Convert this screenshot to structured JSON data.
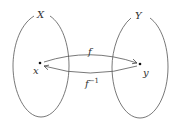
{
  "diagram": {
    "type": "function-mapping",
    "sets": [
      {
        "id": "X",
        "label": "X"
      },
      {
        "id": "Y",
        "label": "Y"
      }
    ],
    "points": [
      {
        "id": "x",
        "label": "x",
        "set": "X"
      },
      {
        "id": "y",
        "label": "y",
        "set": "Y"
      }
    ],
    "arrows": [
      {
        "id": "f",
        "label": "f",
        "from": "x",
        "to": "y"
      },
      {
        "id": "f_inv",
        "label": "f",
        "superscript": "−1",
        "from": "y",
        "to": "x"
      }
    ],
    "colors": {
      "stroke": "#555555",
      "text": "#333333",
      "background": "#ffffff"
    }
  }
}
